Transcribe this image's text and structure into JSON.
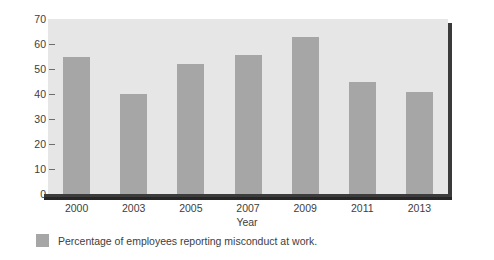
{
  "chart_data": {
    "type": "bar",
    "title": "",
    "subtitle": "",
    "categories": [
      "2000",
      "2003",
      "2005",
      "2007",
      "2009",
      "2011",
      "2013"
    ],
    "values": [
      55,
      40,
      52,
      55.5,
      63,
      45,
      41
    ],
    "series": [
      {
        "name": "Percentage of employees reporting misconduct at work.",
        "values": [
          55,
          40,
          52,
          55.5,
          63,
          45,
          41
        ]
      }
    ],
    "xlabel": "Year",
    "ylabel": "",
    "ylim": [
      0,
      70
    ],
    "ytick_labels": [
      "0",
      "10",
      "20",
      "30",
      "40",
      "50",
      "60",
      "70"
    ],
    "ytick_values": [
      0,
      10,
      20,
      30,
      40,
      50,
      60,
      70
    ],
    "grid": false,
    "legend_position": "bottom-left",
    "bar_color": "#a6a6a6",
    "plot_background": "#e6e6e6",
    "axis_color": "#3c3c3c",
    "text_color": "#3d3d3d"
  },
  "legend": {
    "swatch_name": "legend-color-swatch",
    "label": "Percentage of employees reporting misconduct at work."
  },
  "axes": {
    "x_title": "Year"
  }
}
